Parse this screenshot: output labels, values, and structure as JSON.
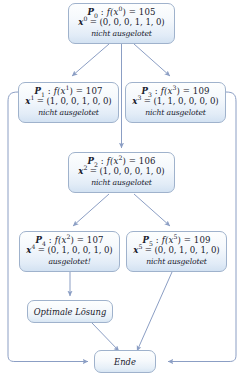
{
  "diagram": {
    "nodes": [
      {
        "id": "p0",
        "label": "P",
        "index": "0",
        "fn": "f(x",
        "fn_sup": "0",
        "fn_close": ") = 105",
        "vec_var": "x",
        "vec_sup": "0",
        "vec_val": " = (0, 0, 0, 1, 1, 0)",
        "status": "nicht ausgelotet"
      },
      {
        "id": "p1",
        "label": "P",
        "index": "1",
        "fn": "f(x",
        "fn_sup": "1",
        "fn_close": ") = 107",
        "vec_var": "x",
        "vec_sup": "1",
        "vec_val": " = (1, 0, 0, 1, 0, 0)",
        "status": "nicht ausgelotet"
      },
      {
        "id": "p3",
        "label": "P",
        "index": "3",
        "fn": "f(x",
        "fn_sup": "3",
        "fn_close": ") = 109",
        "vec_var": "x",
        "vec_sup": "3",
        "vec_val": " = (1, 1, 0, 0, 0, 0)",
        "status": "nicht ausgelotet"
      },
      {
        "id": "p2",
        "label": "P",
        "index": "2",
        "fn": "f(x",
        "fn_sup": "2",
        "fn_close": ") = 106",
        "vec_var": "x",
        "vec_sup": "2",
        "vec_val": " = (1, 0, 0, 0, 1, 0)",
        "status": "nicht ausgelotet"
      },
      {
        "id": "p4",
        "label": "P",
        "index": "4",
        "fn": "f(x",
        "fn_sup": "2",
        "fn_close": ") = 107",
        "vec_var": "x",
        "vec_sup": "4",
        "vec_val": " = (0, 1, 0, 0, 1, 0)",
        "status": "ausgelotet!"
      },
      {
        "id": "p5",
        "label": "P",
        "index": "5",
        "fn": "f(x",
        "fn_sup": "5",
        "fn_close": ") = 109",
        "vec_var": "x",
        "vec_sup": "5",
        "vec_val": " = (0, 0, 1, 0, 1, 0)",
        "status": "nicht ausgelotet"
      }
    ],
    "terminals": {
      "optimal": "Optimale Lösung",
      "end": "Ende"
    },
    "colors": {
      "node_border": "#9fb2cc",
      "node_fill_top": "#fdfefe",
      "node_fill_bottom": "#d3e2f2",
      "edge": "#8b9ec4",
      "text": "#18202c"
    }
  }
}
